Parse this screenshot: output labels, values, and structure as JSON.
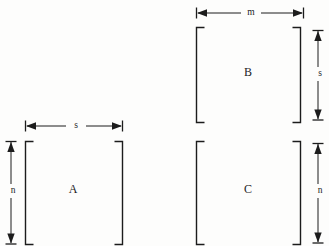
{
  "figure": {
    "background_color": "#fdfdfc",
    "ink_color": "#1c1c1c",
    "matrices": [
      {
        "id": "A",
        "label": "A",
        "bracket_left_x": 25,
        "bracket_right_x": 123,
        "bracket_top_y": 141,
        "bracket_bottom_y": 244,
        "label_x": 73,
        "label_y": 190
      },
      {
        "id": "B",
        "label": "B",
        "bracket_left_x": 196,
        "bracket_right_x": 301,
        "bracket_top_y": 27,
        "bracket_bottom_y": 122,
        "label_x": 248,
        "label_y": 73
      },
      {
        "id": "C",
        "label": "C",
        "bracket_left_x": 196,
        "bracket_right_x": 301,
        "bracket_top_y": 141,
        "bracket_bottom_y": 244,
        "label_x": 248,
        "label_y": 190
      }
    ],
    "dimensions": [
      {
        "id": "A-width",
        "label": "s",
        "orientation": "horizontal",
        "start": 25,
        "end": 123,
        "axis_position": 126,
        "label_x": 74,
        "label_y": 126
      },
      {
        "id": "A-height",
        "label": "n",
        "orientation": "vertical",
        "start": 141,
        "end": 244,
        "axis_position": 11,
        "label_x": 11,
        "label_y": 191
      },
      {
        "id": "B-width",
        "label": "m",
        "orientation": "horizontal",
        "start": 196,
        "end": 303,
        "axis_position": 13,
        "label_x": 249,
        "label_y": 13
      },
      {
        "id": "B-height",
        "label": "s",
        "orientation": "vertical",
        "start": 30,
        "end": 120,
        "axis_position": 318,
        "label_x": 318,
        "label_y": 74
      },
      {
        "id": "C-height",
        "label": "n",
        "orientation": "vertical",
        "start": 143,
        "end": 243,
        "axis_position": 318,
        "label_x": 318,
        "label_y": 191
      }
    ]
  }
}
